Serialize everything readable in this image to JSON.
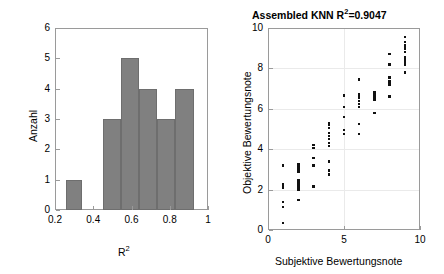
{
  "figure": {
    "width": 444,
    "height": 274,
    "background": "#ffffff",
    "bar_color": "#808080",
    "bar_edge_color": "#6e6e6e",
    "marker_color": "#111111",
    "axis_color": "#9a9a9a"
  },
  "chart_data": [
    {
      "type": "bar",
      "id": "r2-histogram",
      "title": "",
      "xlabel": "R^2",
      "xlabel_base": "R",
      "xlabel_exp": "2",
      "ylabel": "Anzahl",
      "xlim": [
        0.2,
        1.0
      ],
      "ylim": [
        0,
        6
      ],
      "xticks": [
        0.2,
        0.4,
        0.6,
        0.8,
        1
      ],
      "xticklabels": [
        "0.2",
        "0.4",
        "0.6",
        "0.8",
        "1"
      ],
      "yticks": [
        0,
        1,
        2,
        3,
        4,
        5,
        6
      ],
      "yticklabels": [
        "0",
        "1",
        "2",
        "3",
        "4",
        "5",
        "6"
      ],
      "grid": false,
      "bin_edges": [
        0.26,
        0.34,
        0.45,
        0.545,
        0.64,
        0.735,
        0.83,
        0.925
      ],
      "bins": [
        {
          "left": 0.26,
          "right": 0.34,
          "count": 1
        },
        {
          "left": 0.45,
          "right": 0.545,
          "count": 3
        },
        {
          "left": 0.545,
          "right": 0.64,
          "count": 5
        },
        {
          "left": 0.64,
          "right": 0.735,
          "count": 4
        },
        {
          "left": 0.735,
          "right": 0.83,
          "count": 3
        },
        {
          "left": 0.83,
          "right": 0.925,
          "count": 4
        }
      ],
      "values": [
        1,
        3,
        5,
        4,
        3,
        4
      ]
    },
    {
      "type": "scatter",
      "id": "knn-scatter",
      "title": "Assembled KNN R^2=0.9047",
      "title_prefix": "Assembled KNN R",
      "title_exp": "2",
      "title_suffix": "=0.9047",
      "r_squared": 0.9047,
      "model": "Assembled KNN",
      "xlabel": "Subjektive Bewertungsnote",
      "ylabel": "Objektive Bewertungsnote",
      "xlim": [
        0,
        10
      ],
      "ylim": [
        0,
        10
      ],
      "xticks": [
        0,
        5,
        10
      ],
      "xticklabels": [
        "0",
        "5",
        "10"
      ],
      "yticks": [
        0,
        2,
        4,
        6,
        8,
        10
      ],
      "yticklabels": [
        "0",
        "2",
        "4",
        "6",
        "8",
        "10"
      ],
      "grid": true,
      "points": [
        [
          1,
          0.35
        ],
        [
          1,
          1.15
        ],
        [
          1,
          1.4
        ],
        [
          1,
          2.1
        ],
        [
          1,
          2.2
        ],
        [
          1,
          2.25
        ],
        [
          1,
          3.2
        ],
        [
          2,
          1.5
        ],
        [
          2,
          2.0
        ],
        [
          2,
          2.1
        ],
        [
          2,
          2.2
        ],
        [
          2,
          2.3
        ],
        [
          2,
          2.45
        ],
        [
          2,
          2.9
        ],
        [
          2,
          3.0
        ],
        [
          2,
          3.1
        ],
        [
          2,
          3.25
        ],
        [
          3,
          2.15
        ],
        [
          3,
          3.2
        ],
        [
          3,
          3.55
        ],
        [
          3,
          4.05
        ],
        [
          3,
          4.2
        ],
        [
          4,
          2.75
        ],
        [
          4,
          2.95
        ],
        [
          4,
          3.4
        ],
        [
          4,
          4.15
        ],
        [
          4,
          4.3
        ],
        [
          4,
          4.5
        ],
        [
          4,
          4.65
        ],
        [
          4,
          4.8
        ],
        [
          4,
          5.05
        ],
        [
          4,
          5.2
        ],
        [
          4,
          5.3
        ],
        [
          5,
          4.75
        ],
        [
          5,
          4.95
        ],
        [
          5,
          5.6
        ],
        [
          5,
          6.1
        ],
        [
          5,
          6.65
        ],
        [
          6,
          4.75
        ],
        [
          6,
          5.25
        ],
        [
          6,
          6.1
        ],
        [
          6,
          6.25
        ],
        [
          6,
          6.4
        ],
        [
          6,
          6.55
        ],
        [
          6,
          6.7
        ],
        [
          6,
          7.45
        ],
        [
          7,
          5.8
        ],
        [
          7,
          6.45
        ],
        [
          7,
          6.55
        ],
        [
          7,
          6.65
        ],
        [
          7,
          6.75
        ],
        [
          7,
          6.8
        ],
        [
          8,
          6.6
        ],
        [
          8,
          7.2
        ],
        [
          8,
          7.35
        ],
        [
          8,
          7.55
        ],
        [
          8,
          8.2
        ],
        [
          8,
          8.7
        ],
        [
          9,
          7.8
        ],
        [
          9,
          8.2
        ],
        [
          9,
          8.3
        ],
        [
          9,
          8.35
        ],
        [
          9,
          8.45
        ],
        [
          9,
          8.55
        ],
        [
          9,
          8.8
        ],
        [
          9,
          8.95
        ],
        [
          9,
          9.05
        ],
        [
          9,
          9.15
        ],
        [
          9,
          9.3
        ],
        [
          9,
          9.55
        ]
      ]
    }
  ]
}
